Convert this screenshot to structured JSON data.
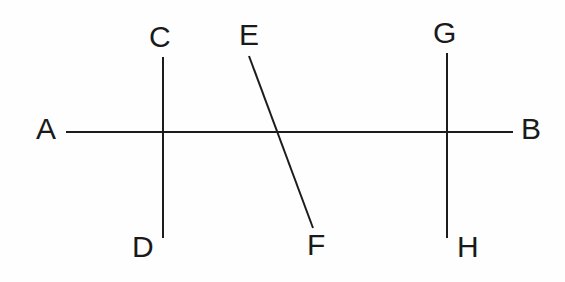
{
  "figure": {
    "background_color": "#fefefe",
    "stroke_color": "#1c1c1c",
    "label_color": "#1a1a1a",
    "width": 565,
    "height": 282
  },
  "labels": {
    "a": "A",
    "b": "B",
    "c": "C",
    "d": "D",
    "e": "E",
    "f": "F",
    "g": "G",
    "h": "H"
  },
  "chart_data": {
    "type": "diagram",
    "xlabel": "",
    "ylabel": "",
    "xlim": [
      0,
      565
    ],
    "ylim": [
      0,
      282
    ],
    "grid": false,
    "legend": null,
    "segments": [
      {
        "name": "AB",
        "from_label": "A",
        "to_label": "B",
        "x1": 66,
        "y1": 132,
        "x2": 513,
        "y2": 132,
        "orientation": "horizontal",
        "stroke_width": 2
      },
      {
        "name": "CD",
        "from_label": "C",
        "to_label": "D",
        "x1": 163,
        "y1": 57,
        "x2": 163,
        "y2": 238,
        "orientation": "vertical",
        "stroke_width": 2
      },
      {
        "name": "EF",
        "from_label": "E",
        "to_label": "F",
        "x1": 249,
        "y1": 56,
        "x2": 313,
        "y2": 228,
        "orientation": "oblique",
        "stroke_width": 2
      },
      {
        "name": "GH",
        "from_label": "G",
        "to_label": "H",
        "x1": 447,
        "y1": 53,
        "x2": 447,
        "y2": 238,
        "orientation": "vertical",
        "stroke_width": 2
      }
    ],
    "intersections": [
      {
        "name": "AB-CD",
        "x": 163,
        "y": 132
      },
      {
        "name": "AB-EF",
        "x": 279,
        "y": 132
      },
      {
        "name": "AB-GH",
        "x": 447,
        "y": 132
      }
    ],
    "label_positions": [
      {
        "label": "A",
        "x": 36,
        "y": 114
      },
      {
        "label": "B",
        "x": 521,
        "y": 114
      },
      {
        "label": "C",
        "x": 149,
        "y": 22
      },
      {
        "label": "D",
        "x": 132,
        "y": 232
      },
      {
        "label": "E",
        "x": 239,
        "y": 20
      },
      {
        "label": "F",
        "x": 307,
        "y": 230
      },
      {
        "label": "G",
        "x": 433,
        "y": 18
      },
      {
        "label": "H",
        "x": 457,
        "y": 232
      }
    ]
  }
}
